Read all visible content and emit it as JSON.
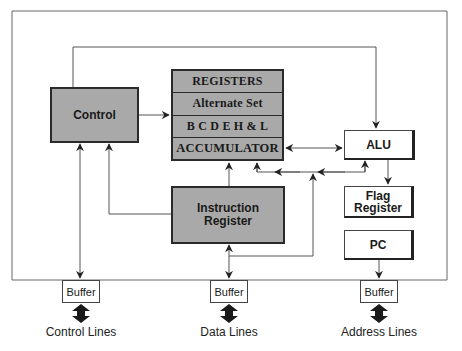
{
  "diagram": {
    "type": "cpu-block-diagram",
    "blocks": {
      "control": "Control",
      "instruction_register": "Instruction\nRegister",
      "instruction_register_line1": "Instruction",
      "instruction_register_line2": "Register",
      "alu": "ALU",
      "flag_register_line1": "Flag",
      "flag_register_line2": "Register",
      "pc": "PC"
    },
    "register_file": {
      "rows": [
        "REGISTERS",
        "Alternate Set",
        "B C D E H & L",
        "ACCUMULATOR"
      ]
    },
    "buffers": {
      "control": "Buffer",
      "data": "Buffer",
      "address": "Buffer"
    },
    "bus_labels": {
      "control": "Control Lines",
      "data": "Data Lines",
      "address": "Address Lines"
    },
    "colors": {
      "gray_fill": "#a9a9a9",
      "line": "#555555",
      "dark": "#222222"
    },
    "connections": [
      {
        "from": "Control",
        "to": "ALU",
        "direction": "one-way"
      },
      {
        "from": "Control",
        "to": "Registers",
        "direction": "one-way"
      },
      {
        "from": "Registers (Accumulator)",
        "to": "ALU",
        "direction": "two-way"
      },
      {
        "from": "Instruction Register",
        "to": "Registers",
        "direction": "one-way"
      },
      {
        "from": "Instruction Register",
        "to": "Control",
        "direction": "one-way"
      },
      {
        "from": "Internal bus",
        "to": "Registers/ALU",
        "direction": "two-way"
      },
      {
        "from": "ALU",
        "to": "Flag Register",
        "direction": "one-way"
      },
      {
        "from": "PC",
        "to": "Address Buffer",
        "direction": "one-way"
      },
      {
        "from": "Control",
        "to": "Control Buffer",
        "direction": "two-way"
      },
      {
        "from": "Data Buffer",
        "to": "Instruction Register",
        "direction": "two-way"
      }
    ]
  }
}
